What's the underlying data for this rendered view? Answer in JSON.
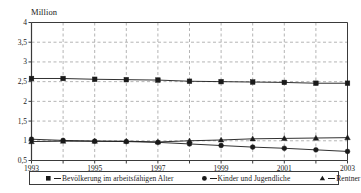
{
  "chart_data": {
    "type": "line",
    "title": "",
    "subtitle": "",
    "xlabel": "",
    "ylabel": "Million",
    "unit_label": "Million",
    "x": [
      1993,
      1994,
      1995,
      1996,
      1997,
      1998,
      1999,
      2000,
      2001,
      2002,
      2003
    ],
    "xtick_labels": [
      "1993",
      "",
      "1995",
      "",
      "1997",
      "",
      "1999",
      "",
      "2001",
      "",
      "2003"
    ],
    "xtick_labels_visible": [
      "1993",
      "1995",
      "1997",
      "1999",
      "2001",
      "2003"
    ],
    "ytick_labels": [
      "0,5",
      "1",
      "1,5",
      "2",
      "2,5",
      "3",
      "3,5",
      "4"
    ],
    "ytick_values": [
      0.5,
      1,
      1.5,
      2,
      2.5,
      3,
      3.5,
      4
    ],
    "ylim": [
      0.5,
      4
    ],
    "xlim": [
      1993,
      2003
    ],
    "grid": true,
    "grid_style": "dashed",
    "grid_color": "#b4b4b4",
    "legend_position": "bottom",
    "series": [
      {
        "name": "Bevölkerung im arbeitsfähigen Alter",
        "marker": "square",
        "color": "#1a1a1a",
        "values": [
          2.58,
          2.58,
          2.56,
          2.55,
          2.54,
          2.51,
          2.5,
          2.49,
          2.48,
          2.46,
          2.46
        ]
      },
      {
        "name": "Kinder und Jugendliche",
        "marker": "circle",
        "color": "#1a1a1a",
        "values": [
          1.04,
          1.01,
          0.99,
          0.98,
          0.96,
          0.92,
          0.88,
          0.84,
          0.81,
          0.77,
          0.73
        ]
      },
      {
        "name": "Rentner",
        "marker": "triangle",
        "color": "#1a1a1a",
        "values": [
          0.98,
          0.99,
          0.99,
          0.99,
          0.97,
          1.0,
          1.02,
          1.05,
          1.06,
          1.07,
          1.08
        ]
      }
    ]
  },
  "legend": {
    "entries": [
      {
        "label": "Bevölkerung im arbeitsfähigen Alter",
        "marker": "square-marker-icon"
      },
      {
        "label": "Kinder und Jugendliche",
        "marker": "circle-marker-icon"
      },
      {
        "label": "Rentner",
        "marker": "triangle-marker-icon"
      }
    ]
  },
  "colors": {
    "axis": "#3a3a3a",
    "grid": "#b4b4b4",
    "series": "#1a1a1a",
    "text": "#1a1a1a",
    "background": "#ffffff"
  }
}
